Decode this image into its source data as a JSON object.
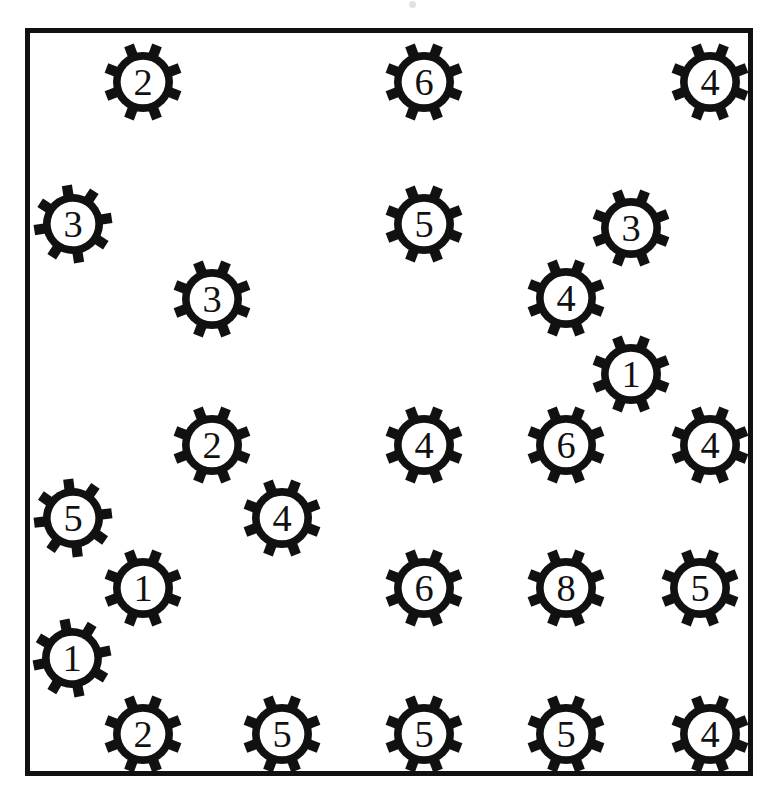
{
  "page": {
    "width": 769,
    "height": 803,
    "background_color": "#ffffff",
    "ink_color": "#111111"
  },
  "frame": {
    "name": "outer-border-rectangle",
    "x": 25,
    "y": 28,
    "width": 728,
    "height": 748,
    "border_width": 5,
    "color": "#111111"
  },
  "artifacts": [
    {
      "name": "scan-speck",
      "x": 412,
      "y": 4,
      "size": 7,
      "color": "#c9c9c9"
    }
  ],
  "legend": {
    "symbol_name": "gear-icon",
    "teeth_count": 8,
    "description": "Thick-outlined circular gear with eight rectangular teeth; a numeral is printed in the open center."
  },
  "gears": [
    {
      "id": "gear-1",
      "value": "2",
      "x": 143,
      "y": 82,
      "r": 30,
      "rot": 0
    },
    {
      "id": "gear-2",
      "value": "6",
      "x": 424,
      "y": 82,
      "r": 30,
      "rot": 0
    },
    {
      "id": "gear-3",
      "value": "4",
      "x": 710,
      "y": 82,
      "r": 30,
      "rot": 0
    },
    {
      "id": "gear-4",
      "value": "3",
      "x": 73,
      "y": 224,
      "r": 30,
      "rot": 12
    },
    {
      "id": "gear-5",
      "value": "5",
      "x": 424,
      "y": 224,
      "r": 30,
      "rot": 0
    },
    {
      "id": "gear-6",
      "value": "3",
      "x": 631,
      "y": 228,
      "r": 30,
      "rot": 0
    },
    {
      "id": "gear-7",
      "value": "3",
      "x": 212,
      "y": 299,
      "r": 30,
      "rot": 0
    },
    {
      "id": "gear-8",
      "value": "4",
      "x": 566,
      "y": 298,
      "r": 30,
      "rot": 0
    },
    {
      "id": "gear-9",
      "value": "1",
      "x": 631,
      "y": 374,
      "r": 30,
      "rot": 0
    },
    {
      "id": "gear-10",
      "value": "2",
      "x": 212,
      "y": 445,
      "r": 30,
      "rot": 0
    },
    {
      "id": "gear-11",
      "value": "4",
      "x": 424,
      "y": 445,
      "r": 30,
      "rot": 0
    },
    {
      "id": "gear-12",
      "value": "6",
      "x": 566,
      "y": 445,
      "r": 30,
      "rot": 0
    },
    {
      "id": "gear-13",
      "value": "4",
      "x": 710,
      "y": 445,
      "r": 30,
      "rot": 0
    },
    {
      "id": "gear-14",
      "value": "5",
      "x": 73,
      "y": 518,
      "r": 30,
      "rot": 14
    },
    {
      "id": "gear-15",
      "value": "4",
      "x": 282,
      "y": 518,
      "r": 30,
      "rot": 0
    },
    {
      "id": "gear-16",
      "value": "1",
      "x": 143,
      "y": 588,
      "r": 30,
      "rot": 0
    },
    {
      "id": "gear-17",
      "value": "6",
      "x": 424,
      "y": 588,
      "r": 30,
      "rot": 0
    },
    {
      "id": "gear-18",
      "value": "8",
      "x": 566,
      "y": 588,
      "r": 30,
      "rot": 0
    },
    {
      "id": "gear-19",
      "value": "5",
      "x": 700,
      "y": 588,
      "r": 30,
      "rot": 0
    },
    {
      "id": "gear-20",
      "value": "1",
      "x": 72,
      "y": 658,
      "r": 30,
      "rot": 10
    },
    {
      "id": "gear-21",
      "value": "2",
      "x": 143,
      "y": 734,
      "r": 30,
      "rot": 0
    },
    {
      "id": "gear-22",
      "value": "5",
      "x": 282,
      "y": 734,
      "r": 30,
      "rot": 0
    },
    {
      "id": "gear-23",
      "value": "5",
      "x": 424,
      "y": 734,
      "r": 30,
      "rot": 0
    },
    {
      "id": "gear-24",
      "value": "5",
      "x": 566,
      "y": 734,
      "r": 30,
      "rot": 0
    },
    {
      "id": "gear-25",
      "value": "4",
      "x": 710,
      "y": 734,
      "r": 30,
      "rot": 0
    }
  ],
  "chart_data": {
    "type": "scatter",
    "xlabel": "",
    "ylabel": "",
    "xlim": [
      25,
      753
    ],
    "ylim": [
      28,
      776
    ],
    "grid": false,
    "legend": "none",
    "marker": "gear-icon",
    "annotation": "Each marker is an 8-toothed gear glyph labelled with an integer value.",
    "points": [
      {
        "x": 143,
        "y": 82,
        "label": "2"
      },
      {
        "x": 424,
        "y": 82,
        "label": "6"
      },
      {
        "x": 710,
        "y": 82,
        "label": "4"
      },
      {
        "x": 73,
        "y": 224,
        "label": "3"
      },
      {
        "x": 424,
        "y": 224,
        "label": "5"
      },
      {
        "x": 631,
        "y": 228,
        "label": "3"
      },
      {
        "x": 212,
        "y": 299,
        "label": "3"
      },
      {
        "x": 566,
        "y": 298,
        "label": "4"
      },
      {
        "x": 631,
        "y": 374,
        "label": "1"
      },
      {
        "x": 212,
        "y": 445,
        "label": "2"
      },
      {
        "x": 424,
        "y": 445,
        "label": "4"
      },
      {
        "x": 566,
        "y": 445,
        "label": "6"
      },
      {
        "x": 710,
        "y": 445,
        "label": "4"
      },
      {
        "x": 73,
        "y": 518,
        "label": "5"
      },
      {
        "x": 282,
        "y": 518,
        "label": "4"
      },
      {
        "x": 143,
        "y": 588,
        "label": "1"
      },
      {
        "x": 424,
        "y": 588,
        "label": "6"
      },
      {
        "x": 566,
        "y": 588,
        "label": "8"
      },
      {
        "x": 700,
        "y": 588,
        "label": "5"
      },
      {
        "x": 72,
        "y": 658,
        "label": "1"
      },
      {
        "x": 143,
        "y": 734,
        "label": "2"
      },
      {
        "x": 282,
        "y": 734,
        "label": "5"
      },
      {
        "x": 424,
        "y": 734,
        "label": "5"
      },
      {
        "x": 566,
        "y": 734,
        "label": "5"
      },
      {
        "x": 710,
        "y": 734,
        "label": "4"
      }
    ],
    "values": [
      2,
      6,
      4,
      3,
      5,
      3,
      3,
      4,
      1,
      2,
      4,
      6,
      4,
      5,
      4,
      1,
      6,
      8,
      5,
      1,
      2,
      5,
      5,
      5,
      4
    ],
    "count": 25,
    "value_counts": {
      "1": 3,
      "2": 3,
      "3": 3,
      "4": 6,
      "5": 6,
      "6": 3,
      "8": 1
    }
  }
}
